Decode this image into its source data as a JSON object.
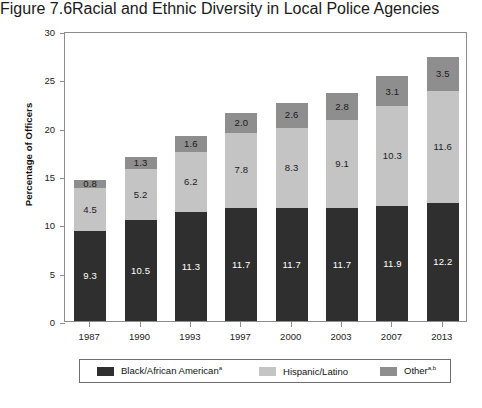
{
  "header": {
    "figure_number": "Figure 7.6",
    "title": "Racial and Ethnic Diversity in Local Police Agencies"
  },
  "chart_data": {
    "type": "bar",
    "subtype": "stacked-bar",
    "title": "Racial and Ethnic Diversity in Local Police Agencies",
    "xlabel": "",
    "ylabel": "Percentage of Officers",
    "ylim": [
      0,
      30
    ],
    "ytick_step": 5,
    "yticks": [
      "30",
      "25",
      "20",
      "15",
      "10",
      "5",
      "0"
    ],
    "grid": false,
    "legend_position": "bottom",
    "categories": [
      "1987",
      "1990",
      "1993",
      "1997",
      "2000",
      "2003",
      "2007",
      "2013"
    ],
    "series": [
      {
        "name": "Black/African American",
        "name_superscript": "a",
        "color": "#2f2f2f",
        "values": [
          9.3,
          10.5,
          11.3,
          11.7,
          11.7,
          11.7,
          11.9,
          12.2
        ],
        "labels": [
          "9.3",
          "10.5",
          "11.3",
          "11.7",
          "11.7",
          "11.7",
          "11.9",
          "12.2"
        ]
      },
      {
        "name": "Hispanic/Latino",
        "name_superscript": "",
        "color": "#c4c4c4",
        "values": [
          4.5,
          5.2,
          6.2,
          7.8,
          8.3,
          9.1,
          10.3,
          11.6
        ],
        "labels": [
          "4.5",
          "5.2",
          "6.2",
          "7.8",
          "8.3",
          "9.1",
          "10.3",
          "11.6"
        ]
      },
      {
        "name": "Other",
        "name_superscript": "a,b",
        "color": "#8e8e8e",
        "values": [
          0.8,
          1.3,
          1.6,
          2.0,
          2.6,
          2.8,
          3.1,
          3.5
        ],
        "labels": [
          "0.8",
          "1.3",
          "1.6",
          "2.0",
          "2.6",
          "2.8",
          "3.1",
          "3.5"
        ]
      }
    ],
    "totals": [
      14.6,
      17.0,
      19.1,
      21.5,
      22.6,
      23.6,
      25.3,
      27.3
    ]
  },
  "legend": {
    "items": [
      {
        "label": "Black/African American",
        "superscript": "a",
        "color": "#2f2f2f"
      },
      {
        "label": "Hispanic/Latino",
        "superscript": "",
        "color": "#c4c4c4"
      },
      {
        "label": "Other",
        "superscript": "a,b",
        "color": "#8e8e8e"
      }
    ]
  }
}
